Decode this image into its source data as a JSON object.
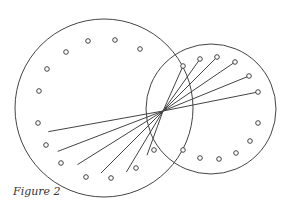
{
  "caption": "Figure 2",
  "colors": {
    "stroke": "#444444",
    "background": "#ffffff"
  },
  "diagram": {
    "large_circle": {
      "cx": 104,
      "cy": 108,
      "r": 89
    },
    "small_circle": {
      "cx": 211,
      "cy": 109,
      "r": 65
    },
    "convergence_point": {
      "x": 163,
      "y": 111
    },
    "large_circle_free_dots": [
      [
        39,
        91
      ],
      [
        47,
        69
      ],
      [
        66,
        52
      ],
      [
        88,
        41
      ],
      [
        115,
        40
      ],
      [
        140,
        49
      ],
      [
        38,
        123
      ],
      [
        46,
        145
      ],
      [
        61,
        163
      ],
      [
        86,
        177
      ],
      [
        111,
        178
      ],
      [
        136,
        168
      ]
    ],
    "small_circle_free_dots": [
      [
        154,
        150
      ],
      [
        183,
        150
      ],
      [
        200,
        158
      ],
      [
        219,
        159
      ],
      [
        236,
        153
      ],
      [
        250,
        141
      ],
      [
        258,
        123
      ]
    ],
    "connected_rays_to_small": [
      [
        183,
        66
      ],
      [
        200,
        59
      ],
      [
        217,
        57
      ],
      [
        235,
        62
      ],
      [
        249,
        76
      ],
      [
        258,
        92
      ]
    ],
    "connected_rays_to_large": [
      [
        41,
        133
      ],
      [
        51,
        154
      ],
      [
        72,
        168
      ],
      [
        97,
        177
      ],
      [
        124,
        176
      ],
      [
        146,
        158
      ]
    ]
  }
}
